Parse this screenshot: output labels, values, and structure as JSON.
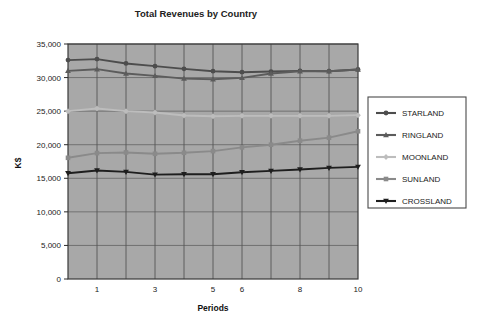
{
  "chart_data": {
    "type": "line",
    "title": "Total Revenues by Country",
    "xlabel": "Periods",
    "ylabel": "K$",
    "x": [
      0,
      1,
      2,
      3,
      4,
      5,
      6,
      7,
      8,
      9,
      10
    ],
    "xtick_labels": [
      "",
      "1",
      "",
      "3",
      "",
      "5",
      "6",
      "",
      "8",
      "",
      "10"
    ],
    "ytick_labels": [
      "0",
      "5,000",
      "10,000",
      "15,000",
      "20,000",
      "25,000",
      "30,000",
      "35,000"
    ],
    "ytick_values": [
      0,
      5000,
      10000,
      15000,
      20000,
      25000,
      30000,
      35000
    ],
    "xlim": [
      0,
      10
    ],
    "ylim": [
      0,
      35000
    ],
    "grid": true,
    "legend_position": "right",
    "plot_background": "#a8a8a8",
    "series": [
      {
        "name": "STARLAND",
        "color": "#4d4d4d",
        "marker": "circle",
        "values": [
          32600,
          32750,
          32100,
          31700,
          31300,
          30950,
          30800,
          30900,
          31000,
          30950,
          31200
        ]
      },
      {
        "name": "RINGLAND",
        "color": "#5c5c5c",
        "marker": "triangle",
        "values": [
          31000,
          31250,
          30600,
          30250,
          29850,
          29750,
          29950,
          30600,
          30950,
          30950,
          31200
        ]
      },
      {
        "name": "MOONLAND",
        "color": "#bdbdbd",
        "marker": "diamond",
        "values": [
          25000,
          25400,
          25000,
          24800,
          24350,
          24250,
          24300,
          24300,
          24300,
          24300,
          24400
        ]
      },
      {
        "name": "SUNLAND",
        "color": "#8a8a8a",
        "marker": "square",
        "values": [
          18050,
          18750,
          18850,
          18650,
          18800,
          19050,
          19600,
          20000,
          20600,
          21050,
          22000
        ]
      },
      {
        "name": "CROSSLAND",
        "color": "#1e1e1e",
        "marker": "triangle-down",
        "values": [
          15750,
          16150,
          15950,
          15550,
          15600,
          15600,
          15900,
          16100,
          16300,
          16550,
          16700
        ]
      }
    ]
  },
  "legend": {
    "items": [
      {
        "label": "STARLAND"
      },
      {
        "label": "RINGLAND"
      },
      {
        "label": "MOONLAND"
      },
      {
        "label": "SUNLAND"
      },
      {
        "label": "CROSSLAND"
      }
    ]
  }
}
